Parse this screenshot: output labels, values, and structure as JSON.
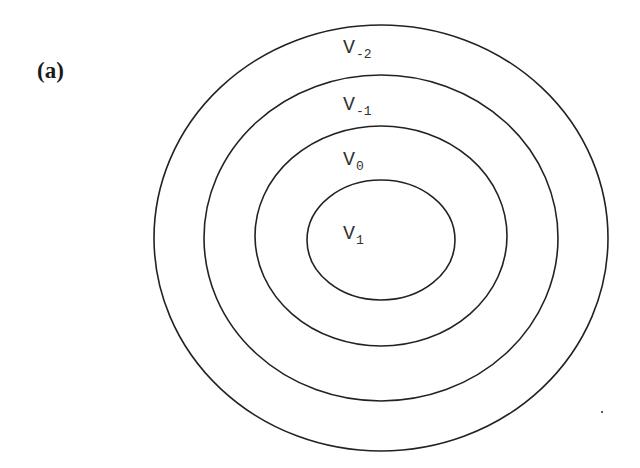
{
  "figure": {
    "panel_label": "(a)",
    "stroke_color": "#222222",
    "label_color": "#333333",
    "background": "#ffffff",
    "rings": [
      {
        "id": "outer",
        "cx": 381,
        "cy": 238,
        "rx": 227,
        "ry": 213,
        "label_main": "V",
        "label_sub": "-2",
        "label_x": 343,
        "label_y": 38
      },
      {
        "id": "second",
        "cx": 381,
        "cy": 238,
        "rx": 177,
        "ry": 163,
        "label_main": "V",
        "label_sub": "-1",
        "label_x": 343,
        "label_y": 95
      },
      {
        "id": "third",
        "cx": 381,
        "cy": 236,
        "rx": 126,
        "ry": 110,
        "label_main": "V",
        "label_sub": "0",
        "label_x": 343,
        "label_y": 150
      },
      {
        "id": "inner",
        "cx": 381,
        "cy": 240,
        "rx": 74,
        "ry": 60,
        "label_main": "V",
        "label_sub": "1",
        "label_x": 343,
        "label_y": 224
      }
    ]
  }
}
